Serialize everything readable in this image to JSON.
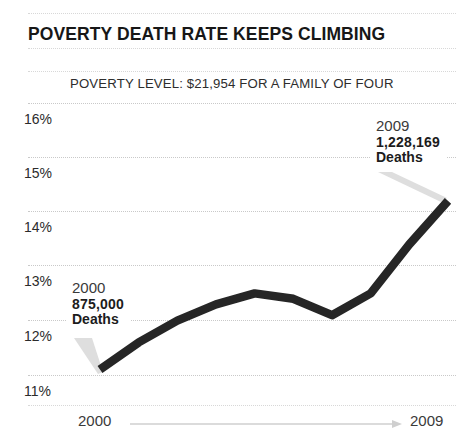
{
  "chart_data": {
    "type": "line",
    "title": "POVERTY DEATH RATE KEEPS CLIMBING",
    "subtitle": "POVERTY LEVEL: $21,954 FOR A FAMILY OF FOUR",
    "xlabel": "",
    "ylabel": "",
    "grid": true,
    "legend": false,
    "xlim": [
      2000,
      2009
    ],
    "ylim": [
      11,
      16
    ],
    "x_tick_labels": [
      "2000",
      "2009"
    ],
    "y_tick_labels": [
      "16%",
      "15%",
      "14%",
      "13%",
      "12%",
      "11%"
    ],
    "y_tick_values": [
      16,
      15,
      14,
      13,
      12,
      11
    ],
    "x": [
      2000,
      2001,
      2002,
      2003,
      2004,
      2005,
      2006,
      2007,
      2008,
      2009
    ],
    "series": [
      {
        "name": "Poverty rate",
        "color": "#262626",
        "values": [
          11.1,
          11.6,
          12.0,
          12.3,
          12.5,
          12.4,
          12.1,
          12.5,
          13.4,
          14.2
        ]
      }
    ],
    "annotations": [
      {
        "id": "callout-2000",
        "year": "2000",
        "value": "875,000",
        "label": "Deaths",
        "point_x": 2000,
        "point_y": 11.1
      },
      {
        "id": "callout-2009",
        "year": "2009",
        "value": "1,228,169",
        "label": "Deaths",
        "point_x": 2009,
        "point_y": 14.2
      }
    ],
    "colors": {
      "line": "#262626",
      "grid": "#c9c9c9",
      "background": "#ffffff",
      "text": "#1c1c1c",
      "leader": "#d5d5d5"
    }
  },
  "axis": {
    "y_ticks": [
      {
        "label": "16%"
      },
      {
        "label": "15%"
      },
      {
        "label": "14%"
      },
      {
        "label": "13%"
      },
      {
        "label": "12%"
      },
      {
        "label": "11%"
      }
    ],
    "x_start_label": "2000",
    "x_end_label": "2009"
  }
}
